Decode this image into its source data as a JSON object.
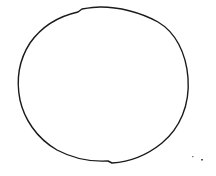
{
  "drawing": {
    "description": "Hand-drawn circle sketch",
    "stroke_color": "#1a1a1a",
    "background": "#ffffff",
    "shape": {
      "type": "circle-sketch",
      "center_x": 103,
      "center_y": 85,
      "radius_x": 86,
      "radius_y": 79
    },
    "stray_marks": [
      {
        "x": 193,
        "y": 157
      },
      {
        "x": 202,
        "y": 160
      }
    ]
  }
}
